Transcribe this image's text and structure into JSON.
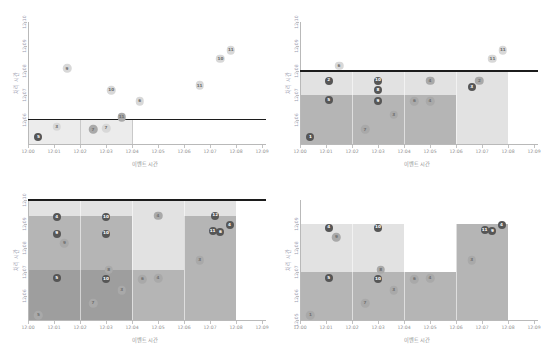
{
  "figure": {
    "panel_count": 4,
    "axis_title_x": "이벤트 시간",
    "axis_title_y": "처리 시간",
    "x_ticks": [
      "12:00",
      "12:01",
      "12:02",
      "12:03",
      "12:04",
      "12:05",
      "12:06",
      "12:07",
      "12:08",
      "12:09"
    ],
    "colors": {
      "threshold_line": "#1c1c1c",
      "axis": "#b9b9b9",
      "band_light": "#e2e2e2",
      "band_mid": "#b5b5b5",
      "band_dark": "#9e9e9e",
      "bubble_light": "#d8d8d8",
      "bubble_mid": "#a9a9a9",
      "bubble_dark": "#565656",
      "tick_text": "#8f8f8f",
      "ylabel_text": "#9b9bb0"
    }
  },
  "chart_data": [
    {
      "id": "panel-top-left",
      "type": "scatter",
      "title": "",
      "xlabel": "이벤트 시간",
      "ylabel": "처리 시간",
      "xlim": [
        "12:00",
        "12:09"
      ],
      "ylim": [
        "12:05",
        "12:10"
      ],
      "x_ticks": [
        "12:00",
        "12:01",
        "12:02",
        "12:03",
        "12:04",
        "12:05",
        "12:06",
        "12:07",
        "12:08",
        "12:09"
      ],
      "y_ticks": [
        "12:06",
        "12:07",
        "12:08",
        "12:09",
        "12:10"
      ],
      "grid": false,
      "legend": "none",
      "threshold": {
        "label": "12:06",
        "y": "12:06"
      },
      "watermark_bands": [
        {
          "x0": "12:00",
          "x1": "12:02",
          "y0": "12:05",
          "y1": "12:06",
          "shade": "light"
        },
        {
          "x0": "12:02",
          "x1": "12:04",
          "y0": "12:05",
          "y1": "12:06",
          "shade": "light"
        }
      ],
      "points": [
        {
          "label": "5",
          "x": "12:00.4",
          "y": "12:05.3",
          "tone": "dark"
        },
        {
          "label": "3",
          "x": "12:01.1",
          "y": "12:05.7",
          "tone": "light"
        },
        {
          "label": "9",
          "x": "12:01.5",
          "y": "12:08.1",
          "tone": "light"
        },
        {
          "label": "7",
          "x": "12:02.5",
          "y": "12:05.6",
          "tone": "mid"
        },
        {
          "label": "7",
          "x": "12:03.0",
          "y": "12:05.65",
          "tone": "light"
        },
        {
          "label": "10",
          "x": "12:03.2",
          "y": "12:07.2",
          "tone": "light"
        },
        {
          "label": "11",
          "x": "12:03.6",
          "y": "12:06.1",
          "tone": "mid"
        },
        {
          "label": "6",
          "x": "12:04.3",
          "y": "12:06.75",
          "tone": "light"
        },
        {
          "label": "11",
          "x": "12:06.6",
          "y": "12:07.4",
          "tone": "light"
        },
        {
          "label": "10",
          "x": "12:07.4",
          "y": "12:08.5",
          "tone": "light"
        },
        {
          "label": "11",
          "x": "12:07.8",
          "y": "12:08.85",
          "tone": "light"
        }
      ]
    },
    {
      "id": "panel-top-right",
      "type": "scatter",
      "title": "",
      "xlabel": "이벤트 시간",
      "ylabel": "처리 시간",
      "xlim": [
        "12:00",
        "12:09"
      ],
      "ylim": [
        "12:05",
        "12:10"
      ],
      "x_ticks": [
        "12:00",
        "12:01",
        "12:02",
        "12:03",
        "12:04",
        "12:05",
        "12:06",
        "12:07",
        "12:08",
        "12:09"
      ],
      "y_ticks": [
        "12:06",
        "12:07",
        "12:08",
        "12:09",
        "12:10"
      ],
      "grid": false,
      "legend": "none",
      "threshold": {
        "label": "12:08",
        "y": "12:08"
      },
      "windows": [
        {
          "x0": "12:00",
          "x1": "12:02",
          "y_light_top": "12:08",
          "y_mid_top": "12:07",
          "y_base": "12:05"
        },
        {
          "x0": "12:02",
          "x1": "12:04",
          "y_light_top": "12:08",
          "y_mid_top": "12:07",
          "y_base": "12:05"
        },
        {
          "x0": "12:04",
          "x1": "12:06",
          "y_light_top": "12:08",
          "y_mid_top": "12:07",
          "y_base": "12:05"
        },
        {
          "x0": "12:06",
          "x1": "12:08",
          "y_light_top": "12:08",
          "y_mid_top": "12:05",
          "y_base": "12:05"
        }
      ],
      "points": [
        {
          "label": "1",
          "x": "12:00.4",
          "y": "12:05.3",
          "tone": "dark"
        },
        {
          "label": "5",
          "x": "12:01.1",
          "y": "12:06.8",
          "tone": "dark"
        },
        {
          "label": "2",
          "x": "12:01.1",
          "y": "12:07.6",
          "tone": "dark"
        },
        {
          "label": "6",
          "x": "12:01.5",
          "y": "12:08.2",
          "tone": "light"
        },
        {
          "label": "7",
          "x": "12:02.5",
          "y": "12:05.6",
          "tone": "mid"
        },
        {
          "label": "9",
          "x": "12:03.0",
          "y": "12:06.75",
          "tone": "dark"
        },
        {
          "label": "8",
          "x": "12:03.0",
          "y": "12:07.2",
          "tone": "dark"
        },
        {
          "label": "10",
          "x": "12:03.0",
          "y": "12:07.6",
          "tone": "dark"
        },
        {
          "label": "3",
          "x": "12:03.6",
          "y": "12:06.2",
          "tone": "mid"
        },
        {
          "label": "6",
          "x": "12:04.4",
          "y": "12:06.75",
          "tone": "mid"
        },
        {
          "label": "4",
          "x": "12:05.0",
          "y": "12:06.75",
          "tone": "mid"
        },
        {
          "label": "4",
          "x": "12:05.0",
          "y": "12:07.6",
          "tone": "mid"
        },
        {
          "label": "3",
          "x": "12:06.6",
          "y": "12:07.35",
          "tone": "dark"
        },
        {
          "label": "2",
          "x": "12:06.9",
          "y": "12:07.6",
          "tone": "mid"
        },
        {
          "label": "11",
          "x": "12:07.4",
          "y": "12:08.5",
          "tone": "light"
        },
        {
          "label": "11",
          "x": "12:07.8",
          "y": "12:08.85",
          "tone": "light"
        }
      ]
    },
    {
      "id": "panel-bottom-left",
      "type": "scatter",
      "title": "",
      "xlabel": "이벤트 시간",
      "ylabel": "처리 시간",
      "xlim": [
        "12:00",
        "12:09"
      ],
      "ylim": [
        "12:05",
        "12:10"
      ],
      "x_ticks": [
        "12:00",
        "12:01",
        "12:02",
        "12:03",
        "12:04",
        "12:05",
        "12:06",
        "12:07",
        "12:08",
        "12:09"
      ],
      "y_ticks": [
        "12:06",
        "12:07",
        "12:08",
        "12:09",
        "12:10"
      ],
      "grid": false,
      "legend": "none",
      "threshold": {
        "label": "12:10",
        "y": "12:10"
      },
      "windows": [
        {
          "x0": "12:00",
          "x1": "12:02",
          "shade_top": "light",
          "shade_mid": "mid",
          "shade_low": "dark"
        },
        {
          "x0": "12:02",
          "x1": "12:04",
          "shade_top": "light",
          "shade_mid": "mid",
          "shade_low": "dark"
        },
        {
          "x0": "12:04",
          "x1": "12:06",
          "shade_top": "light",
          "shade_mid": "light",
          "shade_low": "mid"
        },
        {
          "x0": "12:06",
          "x1": "12:08",
          "shade_top": "light",
          "shade_mid": "mid",
          "shade_low": "mid"
        }
      ],
      "points": [
        {
          "label": "5",
          "x": "12:00.4",
          "y": "12:05.2",
          "tone": "mid"
        },
        {
          "label": "5",
          "x": "12:01.1",
          "y": "12:06.75",
          "tone": "dark"
        },
        {
          "label": "9",
          "x": "12:01.1",
          "y": "12:08.6",
          "tone": "dark"
        },
        {
          "label": "4",
          "x": "12:01.1",
          "y": "12:09.3",
          "tone": "dark"
        },
        {
          "label": "9",
          "x": "12:01.4",
          "y": "12:08.2",
          "tone": "mid"
        },
        {
          "label": "7",
          "x": "12:02.5",
          "y": "12:05.7",
          "tone": "mid"
        },
        {
          "label": "10",
          "x": "12:03.0",
          "y": "12:06.7",
          "tone": "dark"
        },
        {
          "label": "8",
          "x": "12:03.1",
          "y": "12:07.1",
          "tone": "mid"
        },
        {
          "label": "10",
          "x": "12:03.0",
          "y": "12:08.6",
          "tone": "dark"
        },
        {
          "label": "10",
          "x": "12:03.0",
          "y": "12:09.3",
          "tone": "dark"
        },
        {
          "label": "3",
          "x": "12:03.6",
          "y": "12:06.25",
          "tone": "mid"
        },
        {
          "label": "6",
          "x": "12:04.4",
          "y": "12:06.7",
          "tone": "mid"
        },
        {
          "label": "4",
          "x": "12:05.0",
          "y": "12:06.75",
          "tone": "mid"
        },
        {
          "label": "4",
          "x": "12:05.0",
          "y": "12:09.35",
          "tone": "mid"
        },
        {
          "label": "3",
          "x": "12:06.6",
          "y": "12:07.5",
          "tone": "mid"
        },
        {
          "label": "11",
          "x": "12:07.1",
          "y": "12:08.7",
          "tone": "dark"
        },
        {
          "label": "6",
          "x": "12:07.4",
          "y": "12:08.65",
          "tone": "dark"
        },
        {
          "label": "12",
          "x": "12:07.2",
          "y": "12:09.35",
          "tone": "dark"
        },
        {
          "label": "4",
          "x": "12:07.75",
          "y": "12:08.95",
          "tone": "dark"
        }
      ]
    },
    {
      "id": "panel-bottom-right",
      "type": "scatter",
      "title": "",
      "xlabel": "이벤트 시간",
      "ylabel": "처리 시간",
      "xlim": [
        "12:00",
        "12:09"
      ],
      "ylim": [
        "12:05",
        "12:10"
      ],
      "x_ticks": [
        "12:00",
        "12:01",
        "12:02",
        "12:03",
        "12:04",
        "12:05",
        "12:06",
        "12:07",
        "12:08",
        "12:09"
      ],
      "y_ticks": [
        "12:05",
        "12:06",
        "12:07",
        "12:08",
        "12:09"
      ],
      "grid": false,
      "legend": "none",
      "threshold": {
        "label": "none",
        "y": ""
      },
      "windows": [
        {
          "x0": "12:00",
          "x1": "12:02",
          "top": "12:09",
          "mid": "12:07"
        },
        {
          "x0": "12:02",
          "x1": "12:04",
          "top": "12:09",
          "mid": "12:07"
        },
        {
          "x0": "12:04",
          "x1": "12:06",
          "top": "12:07",
          "mid": "12:07"
        },
        {
          "x0": "12:06",
          "x1": "12:08",
          "top": "12:09",
          "mid": "12:09"
        }
      ],
      "points": [
        {
          "label": "1",
          "x": "12:00.4",
          "y": "12:05.2",
          "tone": "mid"
        },
        {
          "label": "5",
          "x": "12:01.1",
          "y": "12:06.75",
          "tone": "dark"
        },
        {
          "label": "4",
          "x": "12:01.1",
          "y": "12:08.85",
          "tone": "dark"
        },
        {
          "label": "9",
          "x": "12:01.4",
          "y": "12:08.45",
          "tone": "mid"
        },
        {
          "label": "7",
          "x": "12:02.5",
          "y": "12:05.7",
          "tone": "mid"
        },
        {
          "label": "10",
          "x": "12:03.0",
          "y": "12:06.7",
          "tone": "dark"
        },
        {
          "label": "8",
          "x": "12:03.1",
          "y": "12:07.1",
          "tone": "mid"
        },
        {
          "label": "10",
          "x": "12:03.0",
          "y": "12:08.85",
          "tone": "dark"
        },
        {
          "label": "3",
          "x": "12:03.6",
          "y": "12:06.25",
          "tone": "mid"
        },
        {
          "label": "6",
          "x": "12:04.4",
          "y": "12:06.7",
          "tone": "mid"
        },
        {
          "label": "4",
          "x": "12:05.0",
          "y": "12:06.75",
          "tone": "mid"
        },
        {
          "label": "3",
          "x": "12:06.6",
          "y": "12:07.5",
          "tone": "mid"
        },
        {
          "label": "11",
          "x": "12:07.1",
          "y": "12:08.75",
          "tone": "dark"
        },
        {
          "label": "9",
          "x": "12:07.4",
          "y": "12:08.7",
          "tone": "dark"
        },
        {
          "label": "4",
          "x": "12:07.75",
          "y": "12:08.95",
          "tone": "dark"
        }
      ]
    }
  ]
}
